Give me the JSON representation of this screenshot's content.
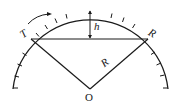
{
  "diagram": {
    "labels": {
      "T": "T",
      "R_point": "R",
      "R_radius": "R",
      "h": "h",
      "O": "O"
    },
    "geometry": {
      "center_O": [
        90,
        89
      ],
      "radius": 79,
      "chord_left_T": [
        31,
        39
      ],
      "chord_right_R": [
        148,
        39
      ],
      "arc_top": [
        90,
        10
      ]
    },
    "colors": {
      "line": "#1a1a1a",
      "background": "#ffffff"
    }
  }
}
